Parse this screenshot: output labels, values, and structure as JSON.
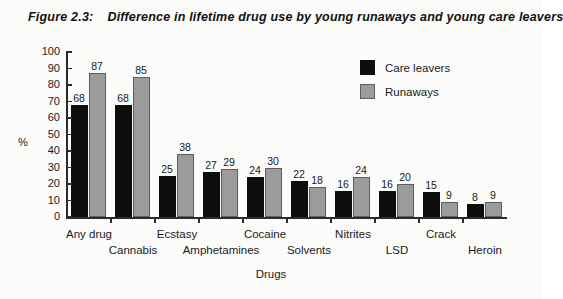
{
  "figure": {
    "number": "Figure 2.3:",
    "title": "Difference in lifetime drug use by young runaways and young care leavers"
  },
  "chart_data": {
    "type": "bar",
    "title": "Difference in lifetime drug use by young runaways and young care leavers",
    "xlabel": "Drugs",
    "ylabel": "%",
    "ylim": [
      0,
      100
    ],
    "ytick_step": 10,
    "yticks": [
      0,
      10,
      20,
      30,
      40,
      50,
      60,
      70,
      80,
      90,
      100
    ],
    "grid": false,
    "legend_position": "upper right",
    "categories": [
      "Any drug",
      "Cannabis",
      "Ecstasy",
      "Amphetamines",
      "Cocaine",
      "Solvents",
      "Nitrites",
      "LSD",
      "Crack",
      "Heroin"
    ],
    "series": [
      {
        "name": "Care leavers",
        "color": "#0d0d0d",
        "values": [
          68,
          68,
          25,
          27,
          24,
          22,
          16,
          16,
          15,
          8
        ]
      },
      {
        "name": "Runaways",
        "color": "#9b9b9b",
        "values": [
          87,
          85,
          38,
          29,
          30,
          18,
          24,
          20,
          9,
          9
        ]
      }
    ]
  }
}
